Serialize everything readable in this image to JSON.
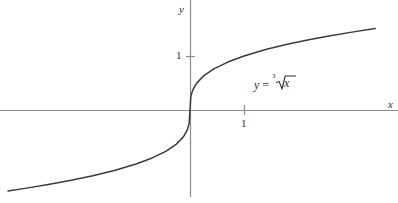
{
  "figure": {
    "title": "",
    "background_color": "#ffffff",
    "width": 398,
    "height": 203
  },
  "labels": {
    "y_axis": "y",
    "x_axis": "x",
    "y_tick_1": "1",
    "x_tick_1": "1"
  },
  "annotation": {
    "lhs": "y",
    "equals": "=",
    "radical_index": "3",
    "radicand": "x",
    "full_text": "y = ∛ x"
  },
  "colors": {
    "axis": "#8a8a8a",
    "curve": "#3a3a3a",
    "text": "#2f2f2f",
    "background": "#ffffff"
  },
  "chart_data": {
    "type": "line",
    "title": "",
    "xlabel": "x",
    "ylabel": "y",
    "function": "y = cbrt(x)",
    "legend": [
      "y = ∛ x"
    ],
    "legend_position": "inside-right",
    "grid": false,
    "xlim": [
      -3.37,
      3.85
    ],
    "ylim": [
      -1.61,
      2.04
    ],
    "origin_px": [
      190,
      110
    ],
    "pixels_per_unit": 54,
    "xticks": [
      1
    ],
    "xticklabels": [
      "1"
    ],
    "yticks": [
      1
    ],
    "yticklabels": [
      "1"
    ],
    "series": [
      {
        "name": "y = ∛ x",
        "x": [
          -3.37,
          -3.0,
          -2.6,
          -2.2,
          -1.8,
          -1.4,
          -1.0,
          -0.7,
          -0.45,
          -0.25,
          -0.12,
          -0.05,
          -0.015,
          0.0,
          0.015,
          0.05,
          0.12,
          0.25,
          0.45,
          0.7,
          1.0,
          1.4,
          1.8,
          2.2,
          2.6,
          3.0,
          3.43
        ],
        "y": [
          -1.5,
          -1.442,
          -1.375,
          -1.301,
          -1.216,
          -1.119,
          -1.0,
          -0.888,
          -0.766,
          -0.63,
          -0.493,
          -0.368,
          -0.247,
          0.0,
          0.247,
          0.368,
          0.493,
          0.63,
          0.766,
          0.888,
          1.0,
          1.119,
          1.216,
          1.301,
          1.375,
          1.442,
          1.508
        ]
      }
    ]
  }
}
